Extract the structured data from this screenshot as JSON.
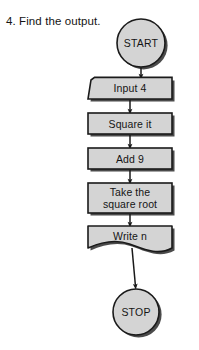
{
  "page": {
    "title": "4. Find the output.",
    "background_color": "#ffffff",
    "width": 199,
    "height": 350
  },
  "flowchart": {
    "fill_color": "#d4d4d4",
    "stroke_color": "#1a1a1a",
    "shadow_color": "#2b2b2b",
    "text_color": "#141414",
    "nodes": [
      {
        "id": "start",
        "shape": "terminal-circle",
        "label": "START",
        "cx": 141,
        "cy": 43,
        "r": 24
      },
      {
        "id": "input",
        "shape": "manual-input",
        "label": "Input 4",
        "x": 88,
        "y": 78,
        "width": 84,
        "height": 21
      },
      {
        "id": "square",
        "shape": "process",
        "label": "Square it",
        "x": 88,
        "y": 113,
        "width": 84,
        "height": 21
      },
      {
        "id": "add",
        "shape": "process",
        "label": "Add 9",
        "x": 88,
        "y": 148,
        "width": 84,
        "height": 21
      },
      {
        "id": "sqrt",
        "shape": "process",
        "label_line1": "Take the",
        "label_line2": "square root",
        "x": 88,
        "y": 183,
        "width": 84,
        "height": 30
      },
      {
        "id": "write",
        "shape": "document",
        "label": "Write n",
        "x": 88,
        "y": 226,
        "width": 84,
        "height": 22
      },
      {
        "id": "stop",
        "shape": "terminal-circle",
        "label": "STOP",
        "cx": 136,
        "cy": 312,
        "r": 23
      }
    ],
    "connectors": [
      {
        "id": "start-to-input",
        "from": "start",
        "to": "input"
      },
      {
        "id": "input-to-square",
        "from": "input",
        "to": "square"
      },
      {
        "id": "square-to-add",
        "from": "square",
        "to": "add"
      },
      {
        "id": "add-to-sqrt",
        "from": "add",
        "to": "sqrt"
      },
      {
        "id": "sqrt-to-write",
        "from": "sqrt",
        "to": "write"
      },
      {
        "id": "write-to-stop",
        "from": "write",
        "to": "stop"
      }
    ]
  }
}
